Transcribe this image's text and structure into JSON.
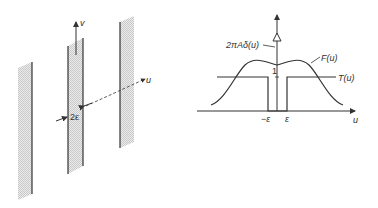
{
  "left_figure": {
    "axis_v_label": "v",
    "axis_u_label": "u",
    "gap_label": "2ε",
    "strip_count": 3
  },
  "right_figure": {
    "delta_label": "2πAδ(u)",
    "F_label": "F(u)",
    "T_label": "T(u)",
    "one_label": "1",
    "neg_eps_label": "−ε",
    "eps_label": "ε",
    "u_axis_label": "u"
  },
  "colors": {
    "line": "#333333",
    "hatch": "#d8d8d8"
  }
}
